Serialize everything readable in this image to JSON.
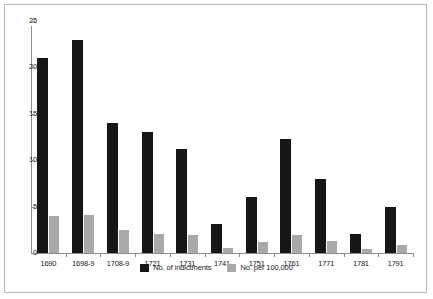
{
  "chart_data": {
    "type": "bar",
    "title": "",
    "xlabel": "",
    "ylabel": "",
    "ylim": [
      0,
      25
    ],
    "yticks": [
      0,
      5,
      10,
      15,
      20,
      25
    ],
    "grid": false,
    "legend_position": "bottom",
    "categories": [
      "1690",
      "1698-9",
      "1708-9",
      "1721",
      "1731",
      "1741",
      "1751",
      "1761",
      "1771",
      "1781",
      "1791"
    ],
    "series": [
      {
        "name": "No. of indictments",
        "color": "#161616",
        "values": [
          21,
          23,
          14,
          13,
          11.2,
          3.1,
          6,
          12.3,
          8,
          2.1,
          5
        ]
      },
      {
        "name": "No. per 100,000",
        "color": "#a9a9a9",
        "values": [
          4,
          4.1,
          2.5,
          2.1,
          1.9,
          0.5,
          1.2,
          1.9,
          1.3,
          0.4,
          0.9
        ]
      }
    ]
  },
  "legend": {
    "items": [
      {
        "label": "No. of indictments",
        "color": "#161616"
      },
      {
        "label": "No. per 100,000",
        "color": "#a9a9a9"
      }
    ]
  }
}
